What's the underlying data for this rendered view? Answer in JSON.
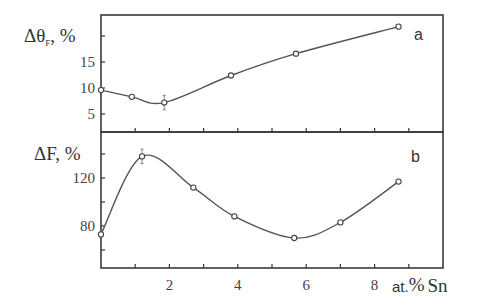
{
  "chart_data": [
    {
      "type": "line",
      "panel": "a",
      "panel_label": "a",
      "ylabel": "Δθ_F, %",
      "ylabel_main": "Δθ",
      "ylabel_sub": "F",
      "ylabel_tail": ", %",
      "xlabel": "at.% Sn",
      "xlim": [
        0,
        10
      ],
      "ylim": [
        1.5,
        23.5
      ],
      "yticks": [
        5,
        10,
        15,
        20
      ],
      "ytick_labels": [
        "5",
        "10",
        "15"
      ],
      "grid": false,
      "series": [
        {
          "name": "Δθ_F",
          "x": [
            0.0,
            0.9,
            1.85,
            3.8,
            5.7,
            8.7
          ],
          "values": [
            9.6,
            8.3,
            7.2,
            12.4,
            16.6,
            21.8
          ],
          "error_bars": [
            0,
            0,
            1.4,
            0,
            0,
            0
          ]
        }
      ]
    },
    {
      "type": "line",
      "panel": "b",
      "panel_label": "b",
      "ylabel": "ΔF, %",
      "xlabel": "at.% Sn",
      "xlim": [
        0,
        10
      ],
      "ylim": [
        45,
        158
      ],
      "yticks": [
        60,
        80,
        100,
        120,
        140
      ],
      "ytick_labels": [
        "80",
        "120"
      ],
      "xticks": [
        0,
        1,
        2,
        3,
        4,
        5,
        6,
        7,
        8,
        9
      ],
      "xtick_labels": [
        "2",
        "4",
        "6",
        "8"
      ],
      "grid": false,
      "series": [
        {
          "name": "ΔF",
          "x": [
            0.0,
            1.2,
            2.7,
            3.9,
            5.65,
            7.0,
            8.7
          ],
          "values": [
            73,
            138,
            112,
            88,
            70,
            83,
            117
          ],
          "error_bars": [
            0,
            6,
            0,
            0,
            0,
            0,
            0
          ]
        }
      ]
    }
  ],
  "labels": {
    "panel_a": "a",
    "panel_b": "b",
    "ylabel_a_main": "Δθ",
    "ylabel_a_sub": "F",
    "ylabel_a_tail": ", %",
    "ylabel_b": "ΔF, %",
    "xunit_prefix": "at.",
    "xunit_percent": "%",
    "xunit_element": "Sn"
  }
}
